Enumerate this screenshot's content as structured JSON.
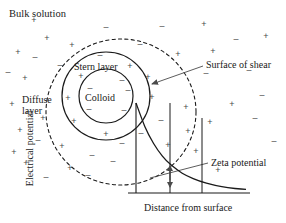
{
  "figure": {
    "width": 286,
    "height": 223,
    "background": "#ffffff",
    "line_color": "#1a1a1a",
    "ion_color": "#4a4a4a"
  },
  "labels": {
    "bulk_solution": "Bulk solution",
    "stern_layer": "Stern layer",
    "colloid": "Colloid",
    "diffuse_layer_line1": "Diffuse",
    "diffuse_layer_line2": "layer",
    "surface_of_shear": "Surface of shear",
    "zeta_potential": "Zeta potential",
    "electrical_potential": "Electrical potential",
    "distance_from_surface": "Distance from surface"
  },
  "chart_data": {
    "type": "line",
    "xlabel": "Distance from surface",
    "ylabel": "Electrical potential",
    "grid": false,
    "legend": null,
    "axes": {
      "x_origin_px": 136,
      "x_end_px": 250,
      "y_top_px": 103,
      "y_bottom_px": 193
    },
    "series": [
      {
        "name": "Electrical potential decay",
        "style": "solid",
        "description": "Monotonic exponential decay of potential from the particle surface toward the bulk solution",
        "x": [
          0.0,
          0.08,
          0.16,
          0.24,
          0.32,
          0.42,
          0.52,
          0.64,
          0.78,
          0.9,
          1.0
        ],
        "y": [
          1.0,
          0.74,
          0.55,
          0.41,
          0.31,
          0.22,
          0.16,
          0.11,
          0.07,
          0.05,
          0.04
        ]
      }
    ],
    "markers": [
      {
        "name": "shear-plane",
        "type": "vertical-line",
        "x": 0.3,
        "description": "Vertical line marking the surface of shear where zeta potential is measured"
      },
      {
        "name": "diffuse-layer-edge",
        "type": "vertical-line",
        "x": 1.0,
        "description": "Vertical line marking the outer edge of the diffuse layer"
      },
      {
        "name": "zeta-potential-arrow",
        "type": "double-arrow",
        "x": 0.3,
        "y_from": 0.33,
        "y_to": 0.0,
        "description": "Double headed arrow indicating the magnitude of the zeta potential at the shear plane"
      }
    ]
  },
  "geometry": {
    "colloid_circle": {
      "cx": 106,
      "cy": 96,
      "r": 27
    },
    "stern_circle": {
      "cx": 106,
      "cy": 96,
      "r": 44
    },
    "diffuse_circle": {
      "cx": 121,
      "cy": 112,
      "rx": 75,
      "ry": 73,
      "dashed": true
    }
  },
  "ions": [
    {
      "sign": "+",
      "x": 34,
      "y": 20
    },
    {
      "sign": "-",
      "x": 106,
      "y": 27
    },
    {
      "sign": "-",
      "x": 162,
      "y": 26
    },
    {
      "sign": "+",
      "x": 204,
      "y": 24
    },
    {
      "sign": "+",
      "x": 47,
      "y": 38
    },
    {
      "sign": "+",
      "x": 72,
      "y": 45
    },
    {
      "sign": "-",
      "x": 140,
      "y": 44
    },
    {
      "sign": "-",
      "x": 236,
      "y": 39
    },
    {
      "sign": "+",
      "x": 266,
      "y": 36
    },
    {
      "sign": "+",
      "x": 18,
      "y": 52
    },
    {
      "sign": "-",
      "x": 35,
      "y": 57
    },
    {
      "sign": "-",
      "x": 100,
      "y": 55
    },
    {
      "sign": "+",
      "x": 178,
      "y": 54
    },
    {
      "sign": "+",
      "x": 213,
      "y": 51
    },
    {
      "sign": "-",
      "x": 60,
      "y": 65
    },
    {
      "sign": "+",
      "x": 130,
      "y": 66
    },
    {
      "sign": "-",
      "x": 8,
      "y": 72
    },
    {
      "sign": "+",
      "x": 25,
      "y": 78
    },
    {
      "sign": "+",
      "x": 81,
      "y": 76
    },
    {
      "sign": "-",
      "x": 122,
      "y": 80
    },
    {
      "sign": "+",
      "x": 148,
      "y": 77
    },
    {
      "sign": "-",
      "x": 206,
      "y": 73
    },
    {
      "sign": "-",
      "x": 249,
      "y": 70
    },
    {
      "sign": "-",
      "x": 90,
      "y": 88
    },
    {
      "sign": "-",
      "x": 128,
      "y": 90
    },
    {
      "sign": "+",
      "x": 68,
      "y": 98
    },
    {
      "sign": "+",
      "x": 152,
      "y": 97
    },
    {
      "sign": "-",
      "x": 262,
      "y": 95
    },
    {
      "sign": "+",
      "x": 12,
      "y": 104
    },
    {
      "sign": "-",
      "x": 89,
      "y": 109
    },
    {
      "sign": "-",
      "x": 124,
      "y": 110
    },
    {
      "sign": "+",
      "x": 186,
      "y": 107
    },
    {
      "sign": "+",
      "x": 232,
      "y": 104
    },
    {
      "sign": "+",
      "x": 43,
      "y": 118
    },
    {
      "sign": "+",
      "x": 74,
      "y": 121
    },
    {
      "sign": "-",
      "x": 161,
      "y": 120
    },
    {
      "sign": "+",
      "x": 210,
      "y": 122
    },
    {
      "sign": "-",
      "x": 255,
      "y": 118
    },
    {
      "sign": "+",
      "x": 20,
      "y": 130
    },
    {
      "sign": "+",
      "x": 106,
      "y": 134
    },
    {
      "sign": "-",
      "x": 141,
      "y": 133
    },
    {
      "sign": "+",
      "x": 188,
      "y": 131
    },
    {
      "sign": "-",
      "x": 38,
      "y": 140
    },
    {
      "sign": "+",
      "x": 62,
      "y": 146
    },
    {
      "sign": "-",
      "x": 122,
      "y": 143
    },
    {
      "sign": "+",
      "x": 168,
      "y": 145
    },
    {
      "sign": "-",
      "x": 274,
      "y": 141
    },
    {
      "sign": "+",
      "x": 14,
      "y": 152
    },
    {
      "sign": "-",
      "x": 92,
      "y": 155
    },
    {
      "sign": "+",
      "x": 196,
      "y": 151
    },
    {
      "sign": "+",
      "x": 26,
      "y": 163
    },
    {
      "sign": "+",
      "x": 70,
      "y": 168
    },
    {
      "sign": "-",
      "x": 113,
      "y": 161
    },
    {
      "sign": "-",
      "x": 46,
      "y": 177
    },
    {
      "sign": "-",
      "x": 88,
      "y": 175
    },
    {
      "sign": "+",
      "x": 218,
      "y": 170
    }
  ]
}
